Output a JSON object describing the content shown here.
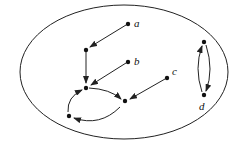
{
  "diagram": {
    "type": "directed-graph",
    "boundary": "ellipse",
    "labels": {
      "a": "a",
      "b": "b",
      "c": "c",
      "d": "d"
    },
    "nodes": [
      {
        "id": "a",
        "label": "a"
      },
      {
        "id": "n1",
        "label": ""
      },
      {
        "id": "b",
        "label": "b"
      },
      {
        "id": "c",
        "label": "c"
      },
      {
        "id": "n2",
        "label": ""
      },
      {
        "id": "n3",
        "label": ""
      },
      {
        "id": "n4",
        "label": ""
      },
      {
        "id": "d_top",
        "label": ""
      },
      {
        "id": "d",
        "label": "d"
      }
    ],
    "edges": [
      {
        "from": "a",
        "to": "n1"
      },
      {
        "from": "n1",
        "to": "n2"
      },
      {
        "from": "b",
        "to": "n2"
      },
      {
        "from": "c",
        "to": "n3"
      },
      {
        "from": "n2",
        "to": "n3"
      },
      {
        "from": "n3",
        "to": "n4"
      },
      {
        "from": "n4",
        "to": "n2"
      },
      {
        "from": "d_top",
        "to": "d"
      },
      {
        "from": "d",
        "to": "d_top"
      }
    ],
    "colors": {
      "stroke": "#222222",
      "background": "#ffffff"
    }
  }
}
